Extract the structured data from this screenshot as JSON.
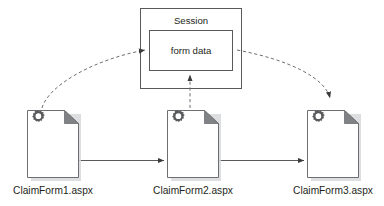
{
  "diagram": {
    "type": "flow-diagram",
    "title_visible": false,
    "background_color": "#ffffff",
    "stroke_color": "#58595b",
    "dashed_stroke_color": "#6d6e71",
    "text_color": "#231f20",
    "gear_color": "#595a5c",
    "fold_color": "#808285",
    "shadow_color": "#d9d9d9"
  },
  "session": {
    "title": "Session",
    "inner_box": {
      "label": "form data"
    }
  },
  "documents": [
    {
      "id": "claimform1",
      "caption": "ClaimForm1.aspx",
      "icon": "document-page-icon",
      "gear_icon": "gear-icon"
    },
    {
      "id": "claimform2",
      "caption": "ClaimForm2.aspx",
      "icon": "document-page-icon",
      "gear_icon": "gear-icon"
    },
    {
      "id": "claimform3",
      "caption": "ClaimForm3.aspx",
      "icon": "document-page-icon",
      "gear_icon": "gear-icon"
    }
  ],
  "connectors": [
    {
      "id": "flow-1-to-2",
      "style": "solid",
      "from": "claimform1",
      "to": "claimform2",
      "arrowhead": "end"
    },
    {
      "id": "flow-2-to-3",
      "style": "solid",
      "from": "claimform2",
      "to": "claimform3",
      "arrowhead": "end"
    },
    {
      "id": "write-1-to-session",
      "style": "dashed",
      "from": "claimform1",
      "to": "form data",
      "arrowhead": "end"
    },
    {
      "id": "write-2-to-session",
      "style": "dashed",
      "from": "claimform2",
      "to": "form data",
      "arrowhead": "end"
    },
    {
      "id": "read-session-to-3",
      "style": "dashed",
      "from": "form data",
      "to": "claimform3",
      "arrowhead": "end"
    }
  ]
}
